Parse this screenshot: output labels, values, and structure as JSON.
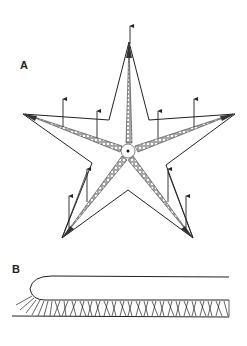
{
  "figure": {
    "panels": [
      {
        "id": "A",
        "label": "A",
        "description": "Starfish (sea star) outline with five arms, tube-foot rows along ambulacral grooves, central mouth, and upward arrows"
      },
      {
        "id": "B",
        "label": "B",
        "description": "Side view of a single arm with tube feet along the underside"
      }
    ]
  },
  "colors": {
    "line": "#222222",
    "background": "#ffffff"
  }
}
